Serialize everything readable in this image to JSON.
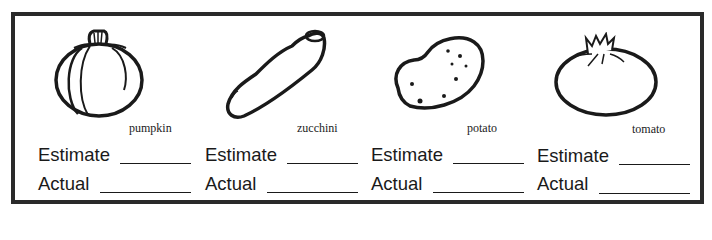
{
  "worksheet": {
    "items": [
      {
        "name": "pumpkin",
        "icon": "pumpkin-icon",
        "estimate_label": "Estimate",
        "estimate_value": "",
        "actual_label": "Actual",
        "actual_value": ""
      },
      {
        "name": "zucchini",
        "icon": "zucchini-icon",
        "estimate_label": "Estimate",
        "estimate_value": "",
        "actual_label": "Actual",
        "actual_value": ""
      },
      {
        "name": "potato",
        "icon": "potato-icon",
        "estimate_label": "Estimate",
        "estimate_value": "",
        "actual_label": "Actual",
        "actual_value": ""
      },
      {
        "name": "tomato",
        "icon": "tomato-icon",
        "estimate_label": "Estimate",
        "estimate_value": "",
        "actual_label": "Actual",
        "actual_value": ""
      }
    ]
  },
  "colors": {
    "ink": "#1a1a1a",
    "border": "#2a2a2a",
    "paper": "#ffffff"
  }
}
